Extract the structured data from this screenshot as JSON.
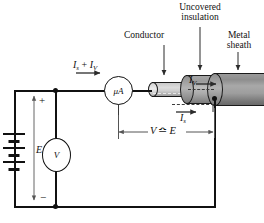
{
  "diagram": {
    "annotations": {
      "conductor": "Conductor",
      "uncovered_insulation_line1": "Uncovered",
      "uncovered_insulation_line2": "insulation",
      "metal_sheath_line1": "Metal",
      "metal_sheath_line2": "sheath"
    },
    "labels": {
      "total_current_I": "I",
      "total_current_sub_s": "s",
      "total_current_plus": " + ",
      "total_current_I2": "I",
      "total_current_sub_v": "V",
      "microammeter": "μA",
      "voltmeter": "V",
      "emf": "E",
      "plus_sign": "+",
      "minus_sign": "−",
      "volume_current_I": "I",
      "volume_current_sub": "V",
      "surface_current_I": "I",
      "surface_current_sub": "s",
      "dimension_V": "V",
      "dimension_approx": "≏",
      "dimension_E": "E"
    },
    "colors": {
      "wire": "#111111",
      "sheath": "#8d8d8d",
      "insulation": "#ababab",
      "conductor": "#d2d2d2",
      "background": "#ffffff"
    }
  }
}
